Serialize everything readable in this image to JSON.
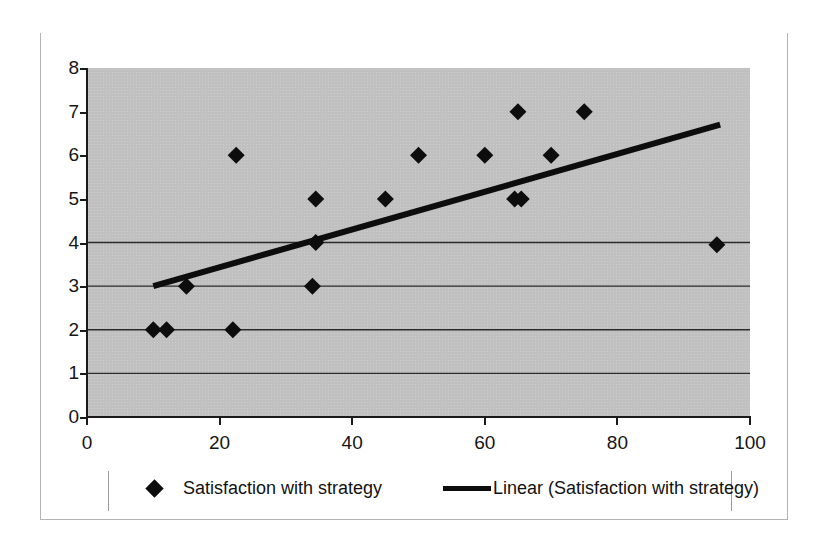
{
  "chart_data": {
    "type": "scatter",
    "title": "",
    "xlabel": "",
    "ylabel": "",
    "xlim": [
      0,
      100
    ],
    "ylim": [
      0,
      8
    ],
    "xticks": [
      0,
      20,
      40,
      60,
      80,
      100
    ],
    "yticks": [
      0,
      1,
      2,
      3,
      4,
      5,
      6,
      7,
      8
    ],
    "grid": "horizontal gridlines at y = 0, 1, 2, 3, 4 only",
    "legend_position": "bottom",
    "series": [
      {
        "name": "Satisfaction with strategy",
        "marker": "diamond",
        "color": "#0d0d0d",
        "points": [
          {
            "x": 10,
            "y": 2
          },
          {
            "x": 12,
            "y": 2
          },
          {
            "x": 15,
            "y": 3
          },
          {
            "x": 22,
            "y": 2
          },
          {
            "x": 22.5,
            "y": 6
          },
          {
            "x": 34,
            "y": 3
          },
          {
            "x": 34.5,
            "y": 4
          },
          {
            "x": 34.5,
            "y": 5
          },
          {
            "x": 45,
            "y": 5
          },
          {
            "x": 50,
            "y": 6
          },
          {
            "x": 60,
            "y": 6
          },
          {
            "x": 64.5,
            "y": 5
          },
          {
            "x": 65.5,
            "y": 5
          },
          {
            "x": 65,
            "y": 7
          },
          {
            "x": 70,
            "y": 6
          },
          {
            "x": 75,
            "y": 7
          },
          {
            "x": 95,
            "y": 3.95
          }
        ]
      },
      {
        "name": "Linear (Satisfaction with strategy)",
        "type": "trendline",
        "color": "#0d0d0d",
        "x_start": 10,
        "y_start": 3.0,
        "x_end": 95.5,
        "y_end": 6.7
      }
    ]
  },
  "legend": {
    "series_label": "Satisfaction with strategy",
    "trendline_label": "Linear (Satisfaction with strategy)",
    "marker_icon": "diamond-marker-icon",
    "line_icon": "line-marker-icon"
  },
  "axes": {
    "y_tick_labels": [
      "8",
      "7",
      "6",
      "5",
      "4",
      "3",
      "2",
      "1",
      "0"
    ],
    "x_tick_labels": [
      "0",
      "20",
      "40",
      "60",
      "80",
      "100"
    ]
  }
}
